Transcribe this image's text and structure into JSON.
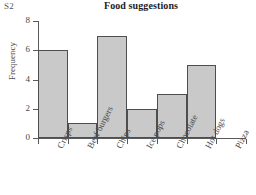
{
  "slide_label": "S2",
  "chart_data": {
    "type": "bar",
    "title": "Food suggestions",
    "xlabel": "",
    "ylabel": "Frequency",
    "categories": [
      "Crisps",
      "Beef burgers",
      "Chips",
      "Ice pops",
      "Chocolate",
      "Hot dogs",
      "Pizza"
    ],
    "values": [
      6,
      1,
      7,
      2,
      3,
      5,
      0
    ],
    "ylim": [
      0,
      8
    ],
    "yticks": [
      0,
      2,
      4,
      6,
      8
    ],
    "ytick_labels": [
      "0",
      "2",
      "4",
      "6",
      "8"
    ],
    "grid": false,
    "legend": false,
    "bar_style": "contiguous",
    "colors": {
      "bar_fill": "#c9c9c9",
      "bar_edge": "#4e4e4e",
      "axis": "#5a5a5a",
      "text": "#4a4a4a",
      "title": "#1d1d1d",
      "background": "#ffffff"
    }
  }
}
